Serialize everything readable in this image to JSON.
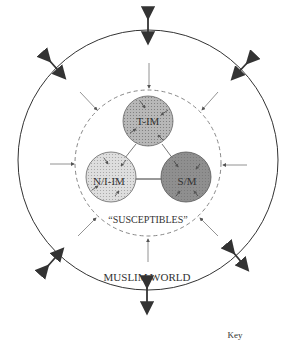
{
  "diagram": {
    "outer_label": "MUSLIM WORLD",
    "inner_label": "“SUSCEPTIBLES”",
    "nodes": [
      {
        "id": "t-im",
        "label": "T-IM",
        "fill": "#b8b8b8"
      },
      {
        "id": "ni-im",
        "label": "N/I-IM",
        "fill": "#dedede"
      },
      {
        "id": "sm",
        "label": "S/M",
        "fill": "#8f8f8f"
      }
    ],
    "key_label": "Key",
    "colors": {
      "line": "#333333",
      "dashed": "#888888",
      "arrow": "#555555"
    }
  }
}
